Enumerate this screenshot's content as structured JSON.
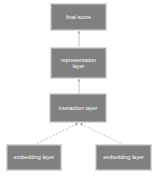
{
  "diagram": {
    "type": "flowchart",
    "direction": "bottom-to-top",
    "colors": {
      "node_fill": "#808080",
      "node_border": "#a9a9a9",
      "node_text": "#ffffff",
      "edge": "#b0b0b0",
      "background": "#ffffff"
    },
    "nodes": [
      {
        "id": "final_score",
        "label": "final score"
      },
      {
        "id": "representation_layer",
        "label": "representation layer"
      },
      {
        "id": "interaction_layer",
        "label": "interaction layer"
      },
      {
        "id": "embedding_layer_left",
        "label": "embedding layer"
      },
      {
        "id": "embedding_layer_right",
        "label": "embedding layer"
      }
    ],
    "edges": [
      {
        "from": "representation_layer",
        "to": "final_score",
        "style": "solid"
      },
      {
        "from": "interaction_layer",
        "to": "representation_layer",
        "style": "solid"
      },
      {
        "from": "embedding_layer_left",
        "to": "interaction_layer",
        "style": "dashed"
      },
      {
        "from": "embedding_layer_right",
        "to": "interaction_layer",
        "style": "dashed"
      }
    ]
  }
}
